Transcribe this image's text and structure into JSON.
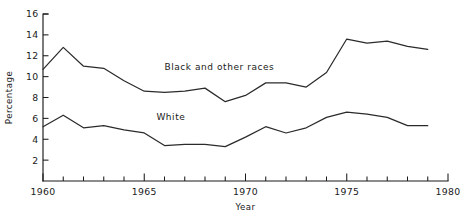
{
  "chart_data": {
    "type": "line",
    "title": "",
    "xlabel": "Year",
    "ylabel": "Percentage",
    "xlim": [
      1960,
      1980
    ],
    "ylim": [
      0,
      16
    ],
    "grid": false,
    "legend_position": "inline-annotation",
    "x_ticks_major": [
      1960,
      1965,
      1970,
      1975,
      1980
    ],
    "x_tick_labels": [
      "1960",
      "1965",
      "1970",
      "1975",
      "1980"
    ],
    "x_ticks_minor": [
      1961,
      1962,
      1963,
      1964,
      1966,
      1967,
      1968,
      1969,
      1971,
      1972,
      1973,
      1974,
      1976,
      1977,
      1978,
      1979
    ],
    "y_ticks": [
      2,
      4,
      6,
      8,
      10,
      12,
      14,
      16
    ],
    "y_tick_labels": [
      "2",
      "4",
      "6",
      "8",
      "10",
      "12",
      "14",
      "16"
    ],
    "x": [
      1960,
      1961,
      1962,
      1963,
      1964,
      1965,
      1966,
      1967,
      1968,
      1969,
      1970,
      1971,
      1972,
      1973,
      1974,
      1975,
      1976,
      1977,
      1978,
      1979
    ],
    "series": [
      {
        "name": "Black and other races",
        "label": "Black and other races",
        "color": "#2b2b2b",
        "label_x": 1966.0,
        "label_y": 10.6,
        "values": [
          10.7,
          12.8,
          11.0,
          10.8,
          9.6,
          8.6,
          8.5,
          8.6,
          8.9,
          7.6,
          8.2,
          9.4,
          9.4,
          9.0,
          10.4,
          13.6,
          13.2,
          13.4,
          12.9,
          12.6
        ]
      },
      {
        "name": "White",
        "label": "White",
        "color": "#2b2b2b",
        "label_x": 1965.6,
        "label_y": 5.8,
        "values": [
          5.2,
          6.3,
          5.1,
          5.3,
          4.9,
          4.6,
          3.4,
          3.5,
          3.5,
          3.3,
          4.2,
          5.2,
          4.6,
          5.1,
          6.1,
          6.6,
          6.4,
          6.1,
          5.3,
          5.3
        ]
      }
    ]
  },
  "layout": {
    "plot_left": 43,
    "plot_right": 448,
    "plot_top": 14,
    "plot_bottom": 181
  }
}
